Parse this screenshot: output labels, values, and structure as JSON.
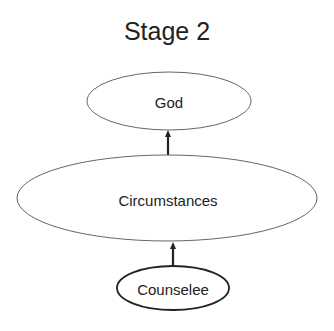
{
  "title": "Stage 2",
  "nodes": [
    {
      "id": "god",
      "label": "God",
      "cx": 169,
      "cy": 101,
      "rx": 82,
      "ry": 29,
      "stroke_width": 1,
      "font_size": 15
    },
    {
      "id": "circumstances",
      "label": "Circumstances",
      "cx": 167,
      "cy": 198,
      "rx": 150,
      "ry": 43,
      "stroke_width": 1,
      "font_size": 15
    },
    {
      "id": "counselee",
      "label": "Counselee",
      "cx": 173,
      "cy": 288,
      "rx": 56,
      "ry": 22,
      "stroke_width": 2,
      "font_size": 15
    }
  ],
  "edges": [
    {
      "from": "circumstances",
      "to": "god"
    },
    {
      "from": "counselee",
      "to": "circumstances"
    }
  ],
  "colors": {
    "stroke": "#555555",
    "heavy_stroke": "#222222",
    "text": "#222222",
    "background": "#ffffff"
  }
}
